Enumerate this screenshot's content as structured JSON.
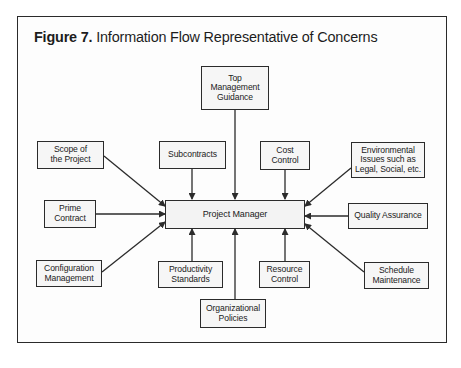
{
  "figure": {
    "label": "Figure 7.",
    "title": "Information Flow Representative of Concerns"
  },
  "center": {
    "label": "Project Manager"
  },
  "nodes": [
    {
      "id": "top-management-guidance",
      "label": "Top\nManagement\nGuidance"
    },
    {
      "id": "scope-of-the-project",
      "label": "Scope of\nthe Project"
    },
    {
      "id": "subcontracts",
      "label": "Subcontracts"
    },
    {
      "id": "cost-control",
      "label": "Cost\nControl"
    },
    {
      "id": "environmental-issues",
      "label": "Environmental\nIssues such as\nLegal, Social, etc."
    },
    {
      "id": "prime-contract",
      "label": "Prime\nContract"
    },
    {
      "id": "quality-assurance",
      "label": "Quality Assurance"
    },
    {
      "id": "configuration-management",
      "label": "Configuration\nManagement"
    },
    {
      "id": "productivity-standards",
      "label": "Productivity\nStandards"
    },
    {
      "id": "resource-control",
      "label": "Resource\nControl"
    },
    {
      "id": "schedule-maintenance",
      "label": "Schedule\nMaintenance"
    },
    {
      "id": "organizational-policies",
      "label": "Organizational\nPolicies"
    }
  ],
  "edges_direction": "all nodes point to Project Manager",
  "colors": {
    "line": "#2b2b2b",
    "box_fill": "#f6f6f6",
    "text": "#222222"
  }
}
